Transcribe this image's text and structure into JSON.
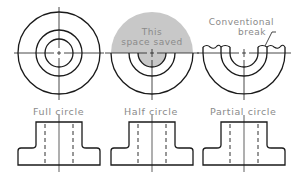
{
  "diagram": {
    "views": [
      {
        "id": "full",
        "label": "Full circle",
        "center_x": 59
      },
      {
        "id": "half",
        "label": "Half circle",
        "center_x": 152
      },
      {
        "id": "partial",
        "label": "Partial circle",
        "center_x": 244
      }
    ],
    "annotations": {
      "space_saved_line1": "This",
      "space_saved_line2": "space saved",
      "break_line1": "Conventional",
      "break_line2": "break"
    },
    "colors": {
      "line": "#1a1a1a",
      "shade": "#c8c8c8",
      "text": "#8a8a8a"
    }
  }
}
